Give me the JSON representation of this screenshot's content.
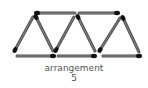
{
  "diagram": {
    "caption_label": "arrangement",
    "caption_number": "5",
    "stick_color": "#7a7a7a",
    "head_color": "#111111",
    "sticks": [
      {
        "x1": 37,
        "y1": 13,
        "x2": 75,
        "y2": 13,
        "head": "start"
      },
      {
        "x1": 79,
        "y1": 13,
        "x2": 117,
        "y2": 13,
        "head": "end"
      },
      {
        "x1": 17,
        "y1": 56,
        "x2": 53,
        "y2": 56,
        "head": "end"
      },
      {
        "x1": 58,
        "y1": 56,
        "x2": 94,
        "y2": 56,
        "head": "end"
      },
      {
        "x1": 103,
        "y1": 56,
        "x2": 139,
        "y2": 56,
        "head": "end"
      },
      {
        "x1": 15,
        "y1": 50,
        "x2": 33,
        "y2": 17,
        "head": "start"
      },
      {
        "x1": 36,
        "y1": 17,
        "x2": 53,
        "y2": 51,
        "head": "start"
      },
      {
        "x1": 56,
        "y1": 50,
        "x2": 74,
        "y2": 17,
        "head": "start"
      },
      {
        "x1": 78,
        "y1": 17,
        "x2": 95,
        "y2": 51,
        "head": "start"
      },
      {
        "x1": 100,
        "y1": 50,
        "x2": 120,
        "y2": 18,
        "head": "start"
      },
      {
        "x1": 123,
        "y1": 18,
        "x2": 139,
        "y2": 52,
        "head": "start"
      }
    ]
  }
}
